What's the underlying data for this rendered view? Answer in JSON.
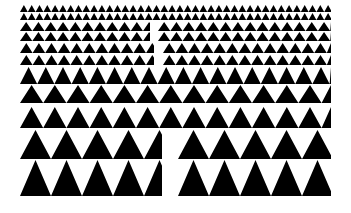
{
  "image": {
    "description": "Pattern of rows of black upward triangles on white, increasing in size from top to bottom",
    "width": 351,
    "height": 213,
    "colors": {
      "background": "#ffffff",
      "foreground": "#000000"
    }
  },
  "rows": [
    {
      "y": 5,
      "h": 7,
      "period": 7.8,
      "segments": [
        [
          20,
          331
        ]
      ]
    },
    {
      "y": 13,
      "h": 7,
      "period": 7.8,
      "segments": [
        [
          20,
          331
        ]
      ]
    },
    {
      "y": 22,
      "h": 9,
      "period": 12.3,
      "segments": [
        [
          20,
          150
        ],
        [
          158,
          331
        ]
      ]
    },
    {
      "y": 32,
      "h": 9,
      "period": 12.3,
      "segments": [
        [
          20,
          150
        ],
        [
          158,
          331
        ]
      ]
    },
    {
      "y": 43,
      "h": 10,
      "period": 12.6,
      "segments": [
        [
          20,
          154
        ],
        [
          163,
          331
        ]
      ]
    },
    {
      "y": 55,
      "h": 10,
      "period": 12.6,
      "segments": [
        [
          20,
          154
        ],
        [
          163,
          331
        ]
      ]
    },
    {
      "y": 67,
      "h": 17,
      "period": 17.2,
      "segments": [
        [
          20,
          331
        ]
      ]
    },
    {
      "y": 85,
      "h": 18,
      "period": 23.2,
      "segments": [
        [
          20,
          331
        ]
      ]
    },
    {
      "y": 107,
      "h": 21,
      "period": 23.2,
      "segments": [
        [
          20,
          331
        ]
      ]
    },
    {
      "y": 130,
      "h": 29,
      "period": 31,
      "segments": [
        [
          20,
          162
        ],
        [
          178,
          331
        ]
      ]
    },
    {
      "y": 160,
      "h": 36,
      "period": 31,
      "segments": [
        [
          20,
          162
        ],
        [
          178,
          331
        ]
      ]
    }
  ]
}
